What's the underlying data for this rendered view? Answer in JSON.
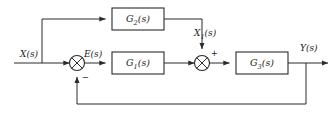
{
  "diagram": {
    "kind": "control-system-block-diagram",
    "background_color": "#ffffff",
    "line_color": "#2b2b2b",
    "text_color": "#1a1a1a",
    "blocks": [
      {
        "id": "feedforward",
        "label_main": "G",
        "label_sub": "2",
        "label_tail": "(s)",
        "x": 112,
        "y": 8,
        "w": 52,
        "h": 22
      },
      {
        "id": "forward",
        "label_main": "G",
        "label_sub": "1",
        "label_tail": "(s)",
        "x": 112,
        "y": 52,
        "w": 52,
        "h": 22
      },
      {
        "id": "plant",
        "label_main": "G",
        "label_sub": "3",
        "label_tail": "(s)",
        "x": 236,
        "y": 52,
        "w": 52,
        "h": 22
      }
    ],
    "junctions": [
      {
        "id": "error-sum",
        "cx": 77,
        "cy": 63,
        "r": 7.5
      },
      {
        "id": "feedforward-sum",
        "cx": 202,
        "cy": 63,
        "r": 7.5
      }
    ],
    "signals": [
      {
        "id": "input",
        "main": "X",
        "sub": "",
        "tail": "(s)",
        "x": 20,
        "y": 50
      },
      {
        "id": "error",
        "main": "E",
        "sub": "",
        "tail": "(s)",
        "x": 84,
        "y": 50
      },
      {
        "id": "feedforward-out",
        "main": "X",
        "sub": "1",
        "tail": "(s)",
        "x": 194,
        "y": 29
      },
      {
        "id": "output",
        "main": "Y",
        "sub": "",
        "tail": "(s)",
        "x": 300,
        "y": 44
      }
    ],
    "signs": [
      {
        "id": "feedback-negative",
        "text": "−",
        "x": 82,
        "y": 74
      },
      {
        "id": "feedforward-positive",
        "text": "+",
        "x": 211,
        "y": 50
      }
    ]
  }
}
